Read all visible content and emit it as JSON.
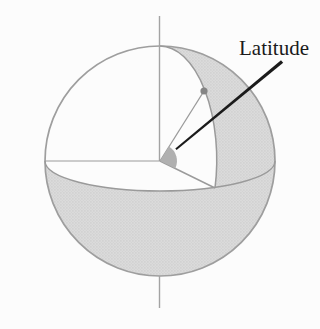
{
  "figure": {
    "label": "Latitude"
  },
  "colors": {
    "background": "#fcfcfc",
    "outline": "#9e9e9e",
    "line": "#9a9a9a",
    "axis": "#a3a3a3",
    "shading_base": "#dbdbdb",
    "shading_dot": "#c7c7c7",
    "shading_dot2": "#cfcfcf",
    "angle_wedge": "#b0b0b0",
    "wedge_edge": "#9a9a9a",
    "surface_point": "#858585",
    "surface_point_edge": "#6f6f6f",
    "leader_line": "#1b1b1b",
    "label_text": "#1a1a1a"
  }
}
